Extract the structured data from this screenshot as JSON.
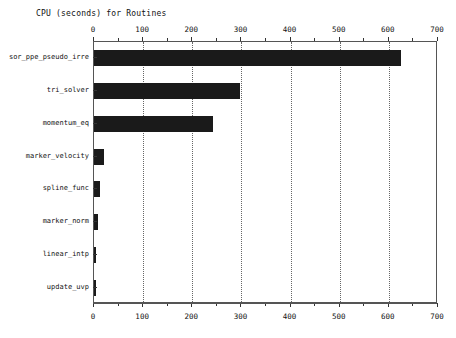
{
  "chart_data": {
    "type": "bar",
    "orientation": "horizontal",
    "title": "CPU (seconds) for Routines",
    "xlabel": "",
    "ylabel": "",
    "categories": [
      "sor_ppe_pseudo_irre",
      "tri_solver",
      "momentum_eq",
      "marker_velocity",
      "spline_func",
      "marker_norm",
      "linear_intp",
      "update_uvp"
    ],
    "values": [
      625,
      297,
      242,
      20,
      12,
      8,
      5,
      4
    ],
    "xlim": [
      0,
      700
    ],
    "xticks": [
      0,
      100,
      200,
      300,
      400,
      500,
      600,
      700
    ],
    "xtick_labels": [
      "0",
      "100",
      "200",
      "300",
      "400",
      "500",
      "600",
      "700"
    ],
    "minor_xticks": [
      50,
      150,
      250,
      350,
      450,
      550,
      650
    ],
    "grid": "vertical-dotted",
    "legend": "none",
    "bar_color": "#1a1a1a",
    "axis_color": "#555555",
    "background": "#ffffff",
    "top_axis": true,
    "bottom_axis": true
  },
  "chart": {
    "title": "CPU (seconds) for Routines"
  }
}
